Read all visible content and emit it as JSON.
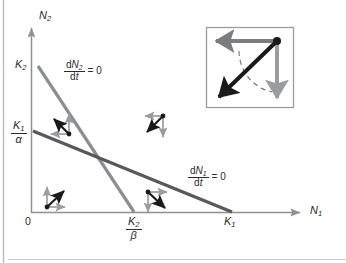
{
  "figure": {
    "domain_type": "chart",
    "background": "#ffffff",
    "margin_rule_color": "#b9bcc0"
  },
  "axes": {
    "x_axis_label": "N",
    "x_axis_label_sub": "1",
    "y_axis_label": "N",
    "y_axis_label_sub": "2",
    "origin_label": "0",
    "axis_color": "#8e9194",
    "x_ticks": [
      {
        "name": "k2-over-beta",
        "num": "K",
        "num_sub": "2",
        "den": "β",
        "x_value": 134
      },
      {
        "name": "k1",
        "label": "K",
        "label_sub": "1",
        "x_value": 232
      }
    ],
    "y_ticks": [
      {
        "name": "k2",
        "label": "K",
        "label_sub": "2",
        "y_value": 66
      },
      {
        "name": "k1-over-alpha",
        "num": "K",
        "num_sub": "1",
        "den": "α",
        "y_value": 131
      }
    ]
  },
  "isoclines": [
    {
      "name": "dn2-dt-zero",
      "label_num_d": "d",
      "label_num_n": "N",
      "label_num_sub": "2",
      "label_den_d": "d",
      "label_den_t": "t",
      "label_rhs": "= 0",
      "color": "#8c8f92",
      "from_y_tick": "k2",
      "to_x_tick": "k2-over-beta"
    },
    {
      "name": "dn1-dt-zero",
      "label_num_d": "d",
      "label_num_n": "N",
      "label_num_sub": "1",
      "label_den_d": "d",
      "label_den_t": "t",
      "label_rhs": "= 0",
      "color": "#58595b",
      "from_y_tick": "k1-over-alpha",
      "to_x_tick": "k1"
    }
  ],
  "vector_triples": [
    {
      "name": "vector-triple-lower-left",
      "region": "below both isoclines",
      "origin": [
        47,
        207
      ],
      "horizontal": "right",
      "vertical": "up",
      "resultant": "up-right",
      "gray": "#9a9da0",
      "black": "#1a1a1a"
    },
    {
      "name": "vector-triple-upper-left",
      "region": "above dN1/dt = 0, below dN2/dt = 0",
      "origin": [
        69,
        134
      ],
      "horizontal": "left",
      "vertical": "up",
      "resultant": "up-left",
      "gray": "#9a9da0",
      "black": "#1a1a1a"
    },
    {
      "name": "vector-triple-lower-middle",
      "region": "above dN2/dt = 0, below dN1/dt = 0",
      "origin": [
        148,
        192
      ],
      "horizontal": "right",
      "vertical": "down",
      "resultant": "down-right",
      "gray": "#9a9da0",
      "black": "#1a1a1a"
    },
    {
      "name": "vector-triple-upper-right",
      "region": "above both isoclines",
      "origin": [
        163,
        116
      ],
      "horizontal": "left",
      "vertical": "down",
      "resultant": "down-left",
      "gray": "#9a9da0",
      "black": "#1a1a1a"
    }
  ],
  "inset": {
    "name": "vector-addition-inset",
    "box": [
      206,
      27,
      88,
      81
    ],
    "border_color": "#9a9da0",
    "point": [
      277,
      41
    ],
    "horizontal_arrow": {
      "direction": "left",
      "color": "#7b7e81",
      "tip_x": 214
    },
    "vertical_arrow": {
      "direction": "down",
      "color": "#9a9da0",
      "tip_y": 100
    },
    "resultant_arrow": {
      "direction": "down-left",
      "color": "#1a1a1a",
      "tip": [
        216,
        100
      ]
    },
    "arc": {
      "style": "dashed",
      "color": "#6e7174"
    }
  }
}
